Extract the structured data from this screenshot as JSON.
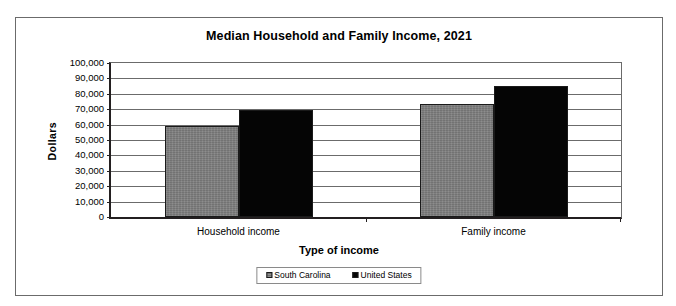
{
  "chart_data": {
    "type": "bar",
    "title": "Median Household and Family Income, 2021",
    "xlabel": "Type of income",
    "ylabel": "Dollars",
    "categories": [
      "Household income",
      "Family income"
    ],
    "series": [
      {
        "name": "South Carolina",
        "color": "#808080",
        "values": [
          59318,
          73618
        ]
      },
      {
        "name": "United States",
        "color": "#000000",
        "values": [
          69717,
          85028
        ]
      }
    ],
    "ylim": [
      0,
      100000
    ],
    "ytick_labels": [
      "100,000",
      "90,000",
      "80,000",
      "70,000",
      "60,000",
      "50,000",
      "40,000",
      "30,000",
      "20,000",
      "10,000",
      "0"
    ],
    "ytick_values": [
      100000,
      90000,
      80000,
      70000,
      60000,
      50000,
      40000,
      30000,
      20000,
      10000,
      0
    ],
    "grid": true,
    "legend_position": "bottom"
  },
  "frame": {
    "border_color": "#6b6b6b"
  }
}
